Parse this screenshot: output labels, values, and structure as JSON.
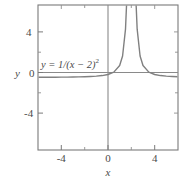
{
  "chart_data": {
    "type": "line",
    "title": "",
    "xlabel": "x",
    "ylabel": "y",
    "equation": "y = 1/(x − 2)²",
    "equation_base": "y = 1/(x − 2)",
    "equation_exponent": "2",
    "xlim": [
      -6,
      6
    ],
    "ylim": [
      -6,
      6
    ],
    "grid": false,
    "legend": "none",
    "asymptote_x": 2,
    "horizontal_asymptote_y": 0,
    "xticks_major": [
      -4,
      0,
      4
    ],
    "xticks_major_labels": [
      "-4",
      "0",
      "4"
    ],
    "xticks_minor": [
      -2,
      2
    ],
    "yticks_major": [
      4,
      0,
      -4
    ],
    "yticks_major_labels": [
      "4",
      "0",
      "-4"
    ],
    "yticks_minor": [
      2,
      -2
    ],
    "series": [
      {
        "name": "y = 1/(x - 2)^2",
        "branch": "left",
        "color": "#808080",
        "x": [
          -6,
          -5.5,
          -5,
          -4.5,
          -4,
          -3.5,
          -3,
          -2.5,
          -2,
          -1.5,
          -1,
          -0.5,
          0,
          0.5,
          1,
          1.25,
          1.5,
          1.6,
          1.7,
          1.75,
          1.8,
          1.85,
          1.9,
          1.93,
          1.95,
          1.96,
          1.97
        ],
        "y": [
          0.0156,
          0.0178,
          0.0204,
          0.0237,
          0.0278,
          0.0331,
          0.04,
          0.0494,
          0.0625,
          0.0816,
          0.1111,
          0.16,
          0.25,
          0.4444,
          1.0,
          1.7778,
          4.0,
          6.25,
          11.11,
          16.0,
          25.0,
          44.44,
          100.0,
          204.1,
          400.0,
          625.0,
          1111.1
        ]
      },
      {
        "name": "y = 1/(x - 2)^2",
        "branch": "right",
        "color": "#808080",
        "x": [
          2.03,
          2.04,
          2.05,
          2.07,
          2.1,
          2.15,
          2.2,
          2.25,
          2.3,
          2.4,
          2.5,
          2.75,
          3,
          3.5,
          4,
          4.5,
          5,
          5.5,
          6
        ],
        "y": [
          1111.1,
          625.0,
          400.0,
          204.1,
          100.0,
          44.44,
          25.0,
          16.0,
          11.11,
          6.25,
          4.0,
          1.7778,
          1.0,
          0.4444,
          0.25,
          0.16,
          0.1111,
          0.0816,
          0.0625
        ]
      }
    ],
    "colors": {
      "curve": "#808080",
      "frame": "#7a7a7a",
      "axis": "#8a8a8a",
      "text": "#4a4a4a",
      "background": "#ffffff"
    }
  }
}
